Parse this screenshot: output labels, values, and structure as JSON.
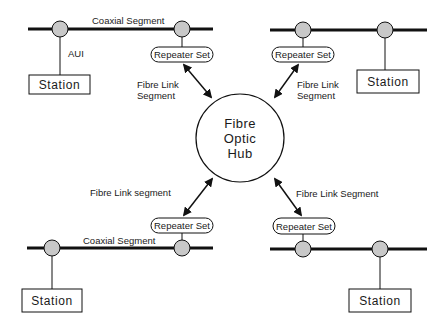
{
  "diagram": {
    "colors": {
      "line": "#111111",
      "tap_fill": "#c8c8c8",
      "background": "#ffffff"
    },
    "hub": {
      "lines": [
        "Fibre",
        "Optic",
        "Hub"
      ]
    },
    "quadrants": {
      "top_left": {
        "segment_label": "Coaxial Segment",
        "aui_label": "AUI",
        "station_label": "Station",
        "repeater_label": "Repeater Set",
        "link_label_lines": [
          "Fibre  Link",
          "Segment"
        ]
      },
      "top_right": {
        "segment_label": "",
        "station_label": "Station",
        "repeater_label": "Repeater Set",
        "link_label_lines": [
          "Fibre  Link",
          "Segment"
        ]
      },
      "bottom_left": {
        "segment_label": "Coaxial Segment",
        "station_label": "Station",
        "repeater_label": "Repeater Set",
        "link_label": "Fibre  Link  segment"
      },
      "bottom_right": {
        "segment_label": "",
        "station_label": "Station",
        "repeater_label": "Repeater Set",
        "link_label": "Fibre  Link  Segment"
      }
    }
  }
}
